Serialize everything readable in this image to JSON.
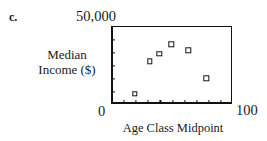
{
  "figure": {
    "panel_letter": "c.",
    "ymax_label": "50,000",
    "ymin_label": "0",
    "xmax_label": "100",
    "ylabel_line1": "Median",
    "ylabel_line2": "Income ($)",
    "xlabel": "Age Class Midpoint"
  },
  "chart_data": {
    "type": "scatter",
    "title": "",
    "subtitle": "",
    "panel": "c.",
    "xlabel": "Age Class Midpoint",
    "ylabel": "Median Income ($)",
    "xlim": [
      0,
      100
    ],
    "ylim": [
      0,
      50000
    ],
    "xticks": [
      10,
      20,
      30,
      40,
      50,
      60,
      70,
      80,
      90
    ],
    "yticks": [
      8333,
      16667,
      25000,
      33333,
      41667
    ],
    "xtick_labels": [
      "0",
      "100"
    ],
    "ytick_labels": [
      "0",
      "50,000"
    ],
    "grid": false,
    "legend": null,
    "marker": "open-square",
    "marker_color": "#141414",
    "series": [
      {
        "name": "Median income by age class",
        "points": [
          {
            "x": 19,
            "y": 7000
          },
          {
            "x": 31,
            "y": 28000
          },
          {
            "x": 39,
            "y": 33000
          },
          {
            "x": 49,
            "y": 39000
          },
          {
            "x": 63,
            "y": 35000
          },
          {
            "x": 78,
            "y": 17000
          }
        ]
      }
    ]
  }
}
